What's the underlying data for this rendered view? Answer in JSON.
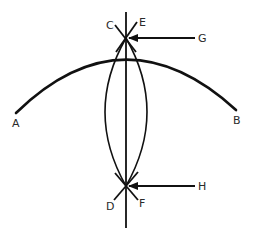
{
  "diagram": {
    "stroke_color": "#111111",
    "label_color": "#2a2a2a",
    "points": {
      "A": {
        "label": "A"
      },
      "B": {
        "label": "B"
      },
      "C": {
        "label": "C"
      },
      "D": {
        "label": "D"
      },
      "E": {
        "label": "E"
      },
      "F": {
        "label": "F"
      },
      "G": {
        "label": "G"
      },
      "H": {
        "label": "H"
      }
    },
    "elements": [
      {
        "id": "arc-AB",
        "type": "arc",
        "from": "A",
        "to": "B"
      },
      {
        "id": "vertical-bisector",
        "type": "line",
        "orientation": "vertical"
      },
      {
        "id": "lens-left-arc",
        "type": "arc"
      },
      {
        "id": "lens-right-arc",
        "type": "arc"
      },
      {
        "id": "arrow-G",
        "type": "arrow",
        "from": "G",
        "points_to": "upper-intersection"
      },
      {
        "id": "arrow-H",
        "type": "arrow",
        "from": "H",
        "points_to": "lower-intersection"
      },
      {
        "id": "mark-CE",
        "type": "crossing-strokes",
        "labels": [
          "C",
          "E"
        ]
      },
      {
        "id": "mark-DF",
        "type": "crossing-strokes",
        "labels": [
          "D",
          "F"
        ]
      }
    ]
  }
}
